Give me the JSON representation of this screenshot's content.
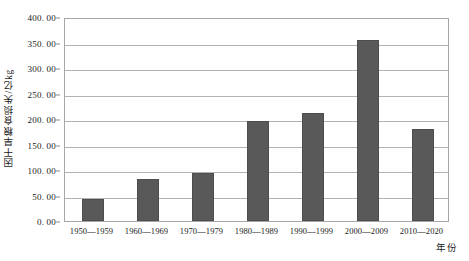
{
  "chart_data": {
    "type": "bar",
    "title": "",
    "xlabel": "年份",
    "ylabel": "因干旱粮食损失/亿kg",
    "categories": [
      "1950—1959",
      "1960—1969",
      "1970—1979",
      "1980—1989",
      "1990—1999",
      "2000—2009",
      "2010—2020"
    ],
    "values": [
      43,
      83,
      95,
      196,
      212,
      355,
      180
    ],
    "ylim": [
      0,
      400
    ],
    "ytick_labels": [
      "0. 00",
      "50. 00",
      "100. 00",
      "150. 00",
      "200. 00",
      "250. 00",
      "300. 00",
      "350. 00",
      "400. 00"
    ],
    "ytick_values": [
      0,
      50,
      100,
      150,
      200,
      250,
      300,
      350,
      400
    ],
    "grid": true,
    "legend": "none",
    "bar_color": "#595959",
    "grid_color": "#b3b3b3",
    "axis_color": "#a6a6a6"
  }
}
